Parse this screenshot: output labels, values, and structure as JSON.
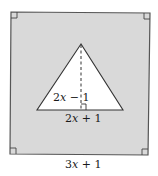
{
  "diagram": {
    "square": {
      "corners": [
        [
          11,
          12
        ],
        [
          150,
          13
        ],
        [
          148,
          155
        ],
        [
          10,
          154
        ]
      ],
      "fill": "#d9d9d9",
      "stroke": "#555555",
      "side_label": {
        "text": "3x + 1",
        "coef": "3",
        "var": "x",
        "rest": " + 1"
      },
      "right_angle_marks": 4
    },
    "triangle": {
      "vertices": [
        [
          81,
          44
        ],
        [
          37,
          110
        ],
        [
          123,
          110
        ]
      ],
      "fill": "#ffffff",
      "stroke": "#333333",
      "base_label": {
        "text": "2x + 1",
        "coef": "2",
        "var": "x",
        "rest": " + 1"
      },
      "height_label": {
        "text": "2x − 1",
        "coef": "2",
        "var": "x",
        "rest": " − 1"
      },
      "altitude": {
        "from": [
          81,
          44
        ],
        "to": [
          81,
          110
        ],
        "style": "dashed"
      },
      "right_angle_mark": true
    }
  }
}
